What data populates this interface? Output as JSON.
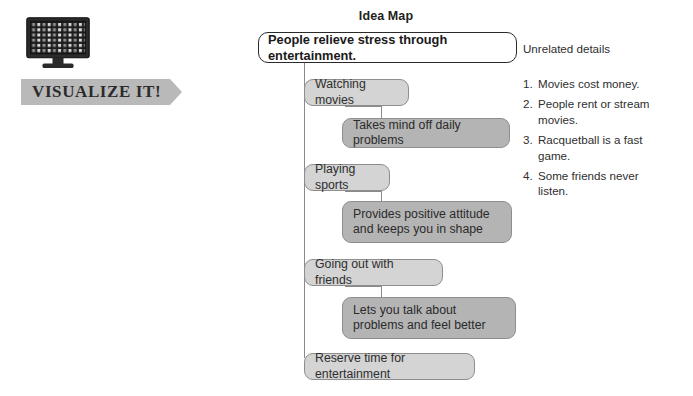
{
  "left_panel": {
    "icon_name": "computer-monitor-icon",
    "banner_label": "VISUALIZE IT!"
  },
  "idea_map": {
    "title": "Idea Map",
    "root": {
      "text": "People relieve stress through entertainment."
    },
    "branches": [
      {
        "main": "Watching movies",
        "detail": "Takes mind off daily problems"
      },
      {
        "main": "Playing sports",
        "detail": "Provides positive attitude and keeps you in shape"
      },
      {
        "main": "Going out with friends",
        "detail": "Lets you talk about problems and feel better"
      }
    ],
    "conclusion": "Reserve time for entertainment"
  },
  "unrelated": {
    "heading": "Unrelated details",
    "items": [
      {
        "number": "1.",
        "text": "Movies cost money."
      },
      {
        "number": "2.",
        "text": "People rent or stream movies."
      },
      {
        "number": "3.",
        "text": "Racquetball is a fast game."
      },
      {
        "number": "4.",
        "text": "Some friends never listen."
      }
    ]
  },
  "colors": {
    "node_main_fill": "#d4d4d4",
    "node_detail_fill": "#b4b4b4",
    "node_border": "#8e8e8e",
    "root_border": "#2a2a2a",
    "connector": "#8a8a8a",
    "banner_fill": "#b9b9b9",
    "screen_dark": "#1c1c1c"
  }
}
